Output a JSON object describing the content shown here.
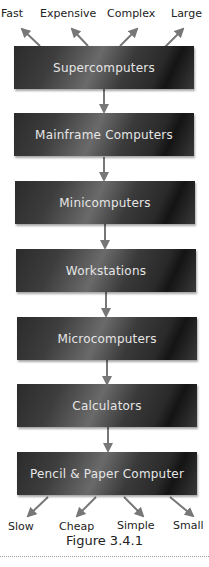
{
  "top_labels": [
    "Fast",
    "Expensive",
    "Complex",
    "Large"
  ],
  "boxes": [
    "Supercomputers",
    "Mainframe Computers",
    "Minicomputers",
    "Workstations",
    "Microcomputers",
    "Calculators",
    "Pencil & Paper Computer"
  ],
  "bottom_labels": [
    "Slow",
    "Cheap",
    "Simple",
    "Small"
  ],
  "caption": "Figure 3.4.1",
  "colors": {
    "arrow": "#777777",
    "box_dark": "#1e1e1e",
    "box_text": "#e6e6e6"
  }
}
